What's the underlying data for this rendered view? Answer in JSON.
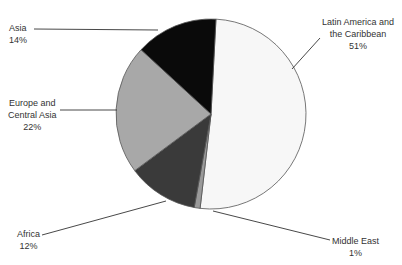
{
  "chart_data": {
    "type": "pie",
    "title_visible_partial": true,
    "slices": [
      {
        "label": "Latin America and the Caribbean",
        "value": 51,
        "display": "51%",
        "color": "#f7f7f7"
      },
      {
        "label": "Middle East",
        "value": 1,
        "display": "1%",
        "color": "#9a9a9a"
      },
      {
        "label": "Africa",
        "value": 12,
        "display": "12%",
        "color": "#3a3a3a"
      },
      {
        "label": "Europe and Central Asia",
        "value": 22,
        "display": "22%",
        "color": "#a8a8a8"
      },
      {
        "label": "Asia",
        "value": 14,
        "display": "14%",
        "color": "#0a0a0a"
      }
    ],
    "start_angle_deg": 3,
    "direction": "clockwise",
    "legend": "none (leader-line labels)"
  },
  "labels": {
    "asia": {
      "name": "Asia",
      "pct": "14%"
    },
    "latam": {
      "line1": "Latin America and",
      "line2": "the Caribbean",
      "pct": "51%"
    },
    "europe": {
      "line1": "Europe and",
      "line2": "Central Asia",
      "pct": "22%"
    },
    "africa": {
      "name": "Africa",
      "pct": "12%"
    },
    "mideast": {
      "name": "Middle East",
      "pct": "1%"
    }
  }
}
